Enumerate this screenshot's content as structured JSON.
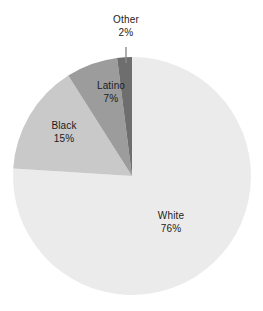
{
  "chart_data": {
    "type": "pie",
    "title": "",
    "subtitle": "",
    "xlabel": "",
    "ylabel": "",
    "grid": false,
    "legend_position": "none",
    "labels_inline": true,
    "start_angle_deg": 90,
    "direction": "counterclockwise",
    "categories": [
      "White",
      "Black",
      "Latino",
      "Other"
    ],
    "values": [
      76,
      15,
      7,
      2
    ],
    "units": "%",
    "slices": [
      {
        "name": "White",
        "value": 76,
        "label": "White",
        "value_label": "76%",
        "color": "#ebebeb",
        "has_leader_line": false
      },
      {
        "name": "Black",
        "value": 15,
        "label": "Black",
        "value_label": "15%",
        "color": "#c9c9c9",
        "has_leader_line": false
      },
      {
        "name": "Latino",
        "value": 7,
        "label": "Latino",
        "value_label": "7%",
        "color": "#9c9c9c",
        "has_leader_line": false
      },
      {
        "name": "Other",
        "value": 2,
        "label": "Other",
        "value_label": "2%",
        "color": "#6e6e6e",
        "has_leader_line": true
      }
    ],
    "geometry": {
      "center_x": 132,
      "center_y": 176,
      "radius": 119,
      "leader_line_x": 126,
      "leader_line_y_top": 47,
      "leader_line_y_bottom": 63,
      "leader_line_color": "#8c8c8c"
    },
    "colors": {
      "background": "#ffffff",
      "text": "#1b1b1b",
      "white_slice": "#ebebeb",
      "black_slice": "#c9c9c9",
      "latino_slice": "#9c9c9c",
      "other_slice": "#6e6e6e",
      "leader_line": "#8c8c8c"
    }
  }
}
